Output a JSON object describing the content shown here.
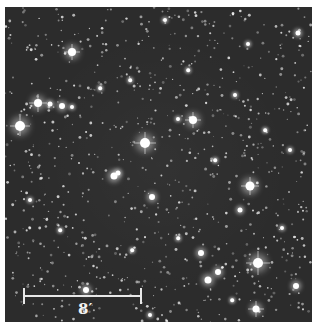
{
  "image": {
    "description": "Grayscale astronomical star field of an open star cluster",
    "background_color": "#2c2c2c",
    "margin_color": "#ffffff"
  },
  "scale_bar": {
    "label": "8′",
    "x1": 24,
    "x2": 141,
    "y": 296,
    "tick_height": 16,
    "label_x": 78,
    "label_y": 302
  },
  "bright_stars": [
    {
      "x": 72,
      "y": 52,
      "r": 4
    },
    {
      "x": 38,
      "y": 103,
      "r": 4
    },
    {
      "x": 62,
      "y": 106,
      "r": 3
    },
    {
      "x": 50,
      "y": 104,
      "r": 2.5
    },
    {
      "x": 72,
      "y": 107,
      "r": 2
    },
    {
      "x": 20,
      "y": 126,
      "r": 5
    },
    {
      "x": 145,
      "y": 143,
      "r": 5
    },
    {
      "x": 193,
      "y": 120,
      "r": 4
    },
    {
      "x": 178,
      "y": 119,
      "r": 2
    },
    {
      "x": 114,
      "y": 176,
      "r": 3.5
    },
    {
      "x": 118,
      "y": 173,
      "r": 2.5
    },
    {
      "x": 152,
      "y": 197,
      "r": 3
    },
    {
      "x": 250,
      "y": 186,
      "r": 4.5
    },
    {
      "x": 240,
      "y": 210,
      "r": 2.5
    },
    {
      "x": 258,
      "y": 263,
      "r": 5
    },
    {
      "x": 201,
      "y": 253,
      "r": 3
    },
    {
      "x": 218,
      "y": 272,
      "r": 3
    },
    {
      "x": 208,
      "y": 280,
      "r": 3.5
    },
    {
      "x": 296,
      "y": 286,
      "r": 3
    },
    {
      "x": 256,
      "y": 309,
      "r": 3.5
    },
    {
      "x": 86,
      "y": 290,
      "r": 3
    },
    {
      "x": 298,
      "y": 33,
      "r": 2.5
    },
    {
      "x": 282,
      "y": 228,
      "r": 2
    },
    {
      "x": 248,
      "y": 44,
      "r": 2
    },
    {
      "x": 165,
      "y": 20,
      "r": 2
    },
    {
      "x": 130,
      "y": 80,
      "r": 1.8
    },
    {
      "x": 100,
      "y": 88,
      "r": 1.8
    },
    {
      "x": 235,
      "y": 95,
      "r": 2
    },
    {
      "x": 265,
      "y": 130,
      "r": 1.8
    },
    {
      "x": 290,
      "y": 150,
      "r": 2
    },
    {
      "x": 30,
      "y": 200,
      "r": 2
    },
    {
      "x": 60,
      "y": 230,
      "r": 1.8
    },
    {
      "x": 132,
      "y": 250,
      "r": 1.8
    },
    {
      "x": 178,
      "y": 238,
      "r": 1.8
    },
    {
      "x": 232,
      "y": 300,
      "r": 1.8
    },
    {
      "x": 150,
      "y": 315,
      "r": 2
    },
    {
      "x": 188,
      "y": 70,
      "r": 1.8
    },
    {
      "x": 215,
      "y": 160,
      "r": 1.8
    }
  ],
  "spiked_stars": [
    {
      "x": 72,
      "y": 52,
      "len": 16
    },
    {
      "x": 38,
      "y": 103,
      "len": 18
    },
    {
      "x": 20,
      "y": 126,
      "len": 20
    },
    {
      "x": 145,
      "y": 143,
      "len": 22
    },
    {
      "x": 193,
      "y": 120,
      "len": 16
    },
    {
      "x": 250,
      "y": 186,
      "len": 18
    },
    {
      "x": 258,
      "y": 263,
      "len": 24
    },
    {
      "x": 256,
      "y": 309,
      "len": 16
    }
  ]
}
